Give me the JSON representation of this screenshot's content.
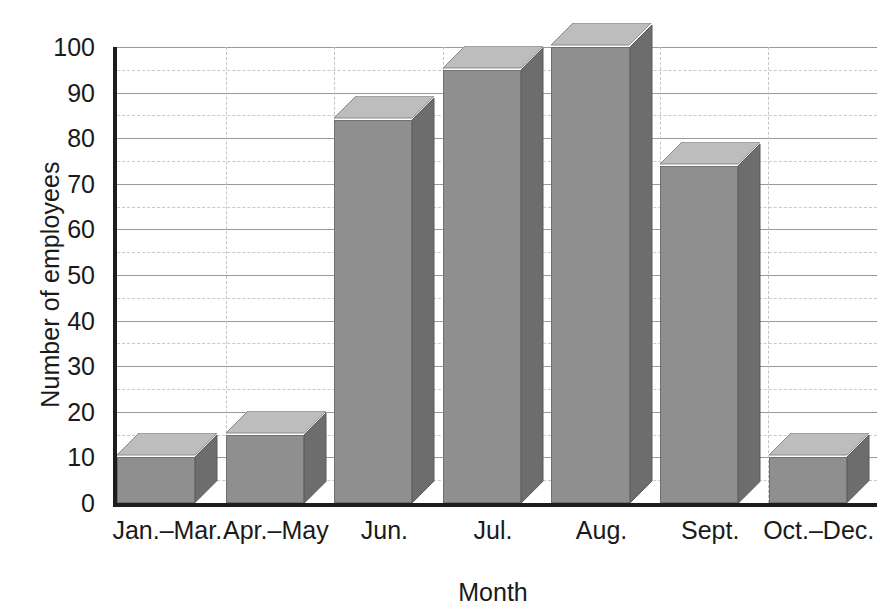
{
  "chart_data": {
    "type": "bar",
    "title": "",
    "subtitle": "",
    "xlabel": "Month",
    "ylabel": "Number of employees",
    "categories": [
      "Jan.–Mar.",
      "Apr.–May",
      "Jun.",
      "Jul.",
      "Aug.",
      "Sept.",
      "Oct.–Dec."
    ],
    "values": [
      10,
      15,
      84,
      95,
      100,
      74,
      10
    ],
    "ylim": [
      0,
      100
    ],
    "ytick_labels": [
      "0",
      "10",
      "20",
      "30",
      "40",
      "50",
      "60",
      "70",
      "80",
      "90",
      "100"
    ],
    "ytick_values": [
      0,
      10,
      20,
      30,
      40,
      50,
      60,
      70,
      80,
      90,
      100
    ],
    "minor_ytick_values": [
      5,
      15,
      25,
      35,
      45,
      55,
      65,
      75,
      85,
      95
    ],
    "grid": "horizontal-major-solid-and-minor-dashed-plus-vertical-dashed-separators",
    "legend": "none",
    "style": "3d-bars",
    "annotations": []
  },
  "colors": {
    "bar_front": "#8f8f8f",
    "bar_top": "#bdbdbd",
    "bar_side": "#6d6d6d",
    "axis": "#1d1d1d",
    "gridline_major": "#9a9a9a",
    "gridline_minor": "#c9c9c9",
    "background": "#ffffff",
    "text": "#1a1a1a"
  }
}
